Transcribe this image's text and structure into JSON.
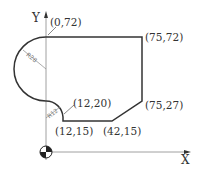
{
  "diagram": {
    "type": "cnc-part-profile",
    "axes": {
      "x_label": "X",
      "y_label": "Y"
    },
    "points": [
      {
        "label": "(0,72)"
      },
      {
        "label": "(75,72)"
      },
      {
        "label": "(75,27)"
      },
      {
        "label": "(42,15)"
      },
      {
        "label": "(12,15)"
      },
      {
        "label": "(12,20)"
      }
    ],
    "radii": [
      {
        "label": "R28"
      },
      {
        "label": "R12"
      }
    ],
    "origin_symbol": "workpiece-zero-icon"
  }
}
